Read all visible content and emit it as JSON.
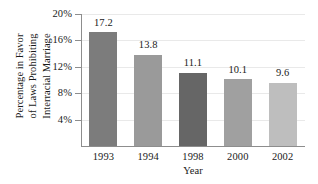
{
  "chart_data": {
    "type": "bar",
    "title": "",
    "subtitle": "",
    "xlabel": "Year",
    "ylabel": "Percentage in Favor of Laws Prohibiting Interracial Marriage",
    "ylabel_lines": [
      "Percentage in Favor",
      "of Laws Prohibiting",
      "Interracial Marriage"
    ],
    "categories": [
      "1993",
      "1994",
      "1998",
      "2000",
      "2002"
    ],
    "values": [
      17.2,
      13.8,
      11.1,
      10.1,
      9.6
    ],
    "value_labels": [
      "17.2",
      "13.8",
      "11.1",
      "10.1",
      "9.6"
    ],
    "bar_colors": [
      "#7c7c7c",
      "#9a9a9a",
      "#666666",
      "#a0a0a0",
      "#bebebe"
    ],
    "ylim": [
      0,
      20
    ],
    "ytick_values": [
      4,
      8,
      12,
      16,
      20
    ],
    "ytick_labels": [
      "4%",
      "8%",
      "12%",
      "16%",
      "20%"
    ],
    "grid": true,
    "grid_axis": "y",
    "grid_color": "#e9e9e9",
    "legend": false,
    "legend_position": "none",
    "axis_color": "#8d8d8d",
    "background_color": "#ffffff"
  },
  "axes": {
    "y_title_line1": "Percentage in Favor",
    "y_title_line2": "of Laws Prohibiting",
    "y_title_line3": "Interracial Marriage",
    "x_title": "Year"
  },
  "ticks": {
    "y": [
      {
        "label": "20%",
        "value": 20
      },
      {
        "label": "16%",
        "value": 16
      },
      {
        "label": "12%",
        "value": 12
      },
      {
        "label": "8%",
        "value": 8
      },
      {
        "label": "4%",
        "value": 4
      }
    ]
  },
  "bars": [
    {
      "category": "1993",
      "value": 17.2,
      "label": "17.2",
      "color": "#7c7c7c"
    },
    {
      "category": "1994",
      "value": 13.8,
      "label": "13.8",
      "color": "#9a9a9a"
    },
    {
      "category": "1998",
      "value": 11.1,
      "label": "11.1",
      "color": "#666666"
    },
    {
      "category": "2000",
      "value": 10.1,
      "label": "10.1",
      "color": "#a0a0a0"
    },
    {
      "category": "2002",
      "value": 9.6,
      "label": "9.6",
      "color": "#bebebe"
    }
  ]
}
